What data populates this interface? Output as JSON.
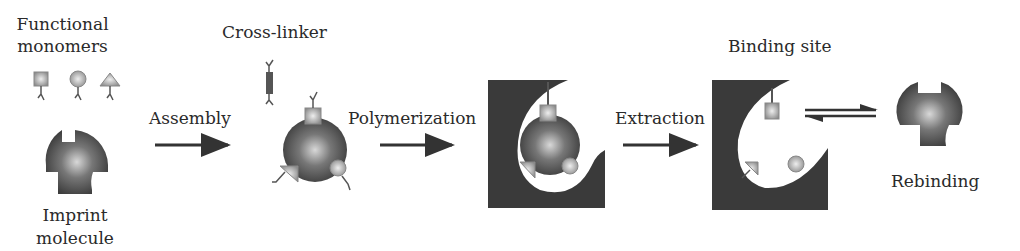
{
  "labels": {
    "functional_monomers_1": "Functional",
    "functional_monomers_2": "monomers",
    "imprint_1": "Imprint",
    "imprint_2": "molecule",
    "cross_linker": "Cross-linker",
    "assembly": "Assembly",
    "polymerization": "Polymerization",
    "extraction": "Extraction",
    "binding_site": "Binding site",
    "rebinding": "Rebinding"
  },
  "steps": [
    "Assembly",
    "Polymerization",
    "Extraction",
    "Rebinding"
  ],
  "colors": {
    "polymer": "#3a3a3a",
    "template": "#555555",
    "monomer": "#9a9a9a",
    "arrow": "#333333"
  }
}
